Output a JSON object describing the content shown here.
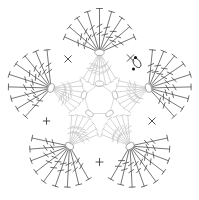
{
  "document": {
    "title": "Crochet Motif Chart",
    "kind": "crochet-stitch-diagram",
    "background_color": "#ffffff"
  },
  "colors": {
    "outer_stitch": "#4a4a4a",
    "inner_stitch": "#c3c3c3",
    "hub_outline": "#9a9a9a",
    "ring_outline": "#b5b5b5",
    "marker": "#3d3d3d",
    "dot": "#111111"
  },
  "motif": {
    "shape": "five-point-flower",
    "point_count": 5,
    "center": {
      "x": 99.5,
      "y": 100
    },
    "rounds": [
      {
        "index": 1,
        "name": "center-ring",
        "symbol": "chain",
        "count": 5,
        "tone": "light"
      },
      {
        "index": 2,
        "name": "inner-fans",
        "symbol": "treble-crochet",
        "tone": "light"
      },
      {
        "index": 3,
        "name": "outer-fans",
        "symbol": "treble-crochet",
        "tone": "dark"
      }
    ]
  },
  "center_ring": {
    "radius": 16,
    "ovals": [
      {
        "id": "ring-oval-top",
        "x": 99.5,
        "y": 83.5,
        "angle": 0
      },
      {
        "id": "ring-oval-upper-right",
        "x": 115.0,
        "y": 95.0,
        "angle": 72
      },
      {
        "id": "ring-oval-lower-right",
        "x": 109.5,
        "y": 113.5,
        "angle": 144
      },
      {
        "id": "ring-oval-lower-left",
        "x": 89.5,
        "y": 113.5,
        "angle": 216
      },
      {
        "id": "ring-oval-upper-left",
        "x": 84.0,
        "y": 95.0,
        "angle": 288
      }
    ]
  },
  "hubs": [
    {
      "id": "hub-top",
      "label": "Top fan",
      "x": 99.5,
      "y": 52.5,
      "angle": -90,
      "inner_angle": 90,
      "outer_spokes": 9,
      "inner_spokes": 7
    },
    {
      "id": "hub-right",
      "label": "Right fan",
      "x": 148.5,
      "y": 88.0,
      "angle": -18,
      "inner_angle": 162,
      "outer_spokes": 9,
      "inner_spokes": 7
    },
    {
      "id": "hub-bottom-right",
      "label": "Bottom right fan",
      "x": 130.0,
      "y": 146.0,
      "angle": 54,
      "inner_angle": 234,
      "outer_spokes": 9,
      "inner_spokes": 7
    },
    {
      "id": "hub-bottom-left",
      "label": "Bottom left fan",
      "x": 69.5,
      "y": 146.0,
      "angle": 126,
      "inner_angle": 306,
      "outer_spokes": 9,
      "inner_spokes": 7
    },
    {
      "id": "hub-left",
      "label": "Left fan",
      "x": 51.0,
      "y": 88.0,
      "angle": 198,
      "inner_angle": 18,
      "outer_spokes": 9,
      "inner_spokes": 7
    }
  ],
  "fan": {
    "outer_spread_deg": 132,
    "outer_length": 44,
    "inner_spread_deg": 64,
    "inner_length": 34,
    "tick_count": 2,
    "top_bar_length": 6
  },
  "single_crochet_markers": [
    {
      "id": "sc-upper-left",
      "glyph": "x",
      "x": 68.0,
      "y": 59.0,
      "size": 6.5
    },
    {
      "id": "sc-upper-right",
      "glyph": "x",
      "x": 130.5,
      "y": 58.0,
      "size": 6.5
    },
    {
      "id": "sc-left",
      "glyph": "+",
      "x": 46.5,
      "y": 121.0,
      "size": 6.5
    },
    {
      "id": "sc-right",
      "glyph": "x",
      "x": 152.0,
      "y": 121.0,
      "size": 6.5
    },
    {
      "id": "sc-bottom",
      "glyph": "+",
      "x": 99.5,
      "y": 162.0,
      "size": 7.0
    }
  ],
  "start_marker": {
    "id": "start-marker",
    "x": 137.0,
    "y": 63.0,
    "oval_rx": 3.2,
    "oval_ry": 5.2,
    "oval_rotation": -35,
    "dots": [
      {
        "x": 135.5,
        "y": 57.5,
        "r": 1.5
      },
      {
        "x": 133.5,
        "y": 69.0,
        "r": 1.5
      }
    ]
  },
  "legend": {
    "treble_crochet": "treble-crochet",
    "chain": "chain",
    "single_crochet": "single-crochet"
  }
}
